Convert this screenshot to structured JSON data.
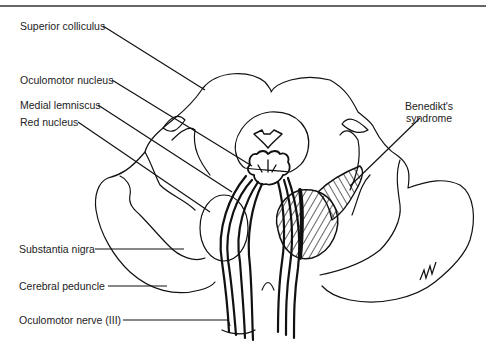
{
  "figure": {
    "colors": {
      "line": "#111111",
      "background": "#ffffff",
      "text": "#222222"
    }
  },
  "labels": {
    "superior_colliculus": "Superior colliculus",
    "oculomotor_nucleus": "Oculomotor nucleus",
    "medial_lemniscus": "Medial lemniscus",
    "red_nucleus": "Red nucleus",
    "substantia_nigra": "Substantia nigra",
    "cerebral_peduncle": "Cerebral peduncle",
    "oculomotor_nerve": "Oculomotor nerve (III)",
    "benedikt_line1": "Benedikt's",
    "benedikt_line2": "syndrome",
    "signature": "G.M."
  }
}
